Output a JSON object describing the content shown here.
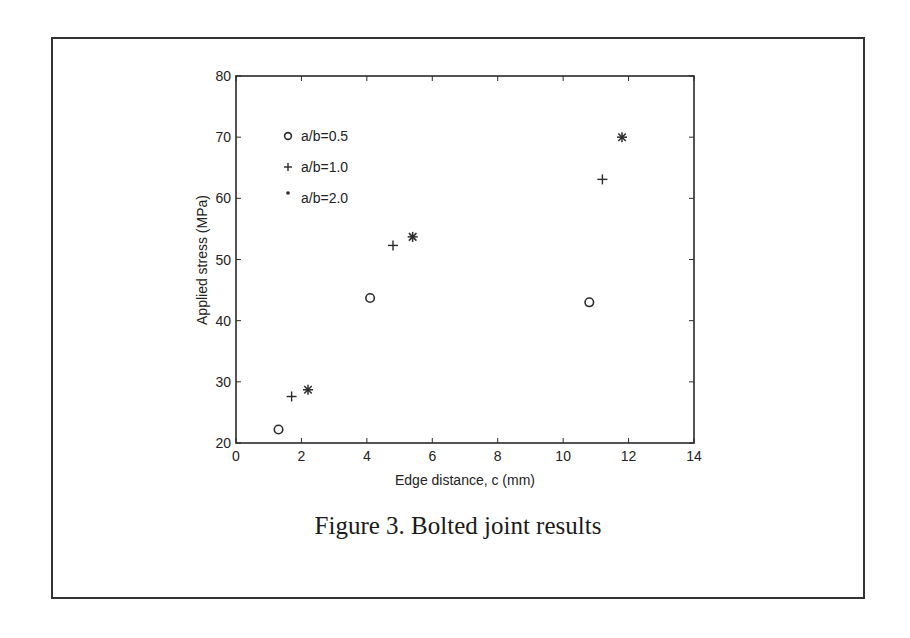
{
  "figure": {
    "caption": "Figure 3. Bolted joint results"
  },
  "chart_data": {
    "type": "scatter",
    "title": "",
    "xlabel": "Edge distance, c (mm)",
    "ylabel": "Applied stress (MPa)",
    "xlim": [
      0,
      14
    ],
    "ylim": [
      20,
      80
    ],
    "xticks": [
      0,
      2,
      4,
      6,
      8,
      10,
      12,
      14
    ],
    "yticks": [
      20,
      30,
      40,
      50,
      60,
      70,
      80
    ],
    "grid": false,
    "legend_position": "upper left (inside axes)",
    "series": [
      {
        "name": "a/b=0.5",
        "marker": "circle",
        "points": [
          [
            1.3,
            22.2
          ],
          [
            4.1,
            43.7
          ],
          [
            10.8,
            43.0
          ]
        ]
      },
      {
        "name": "a/b=1.0",
        "marker": "plus",
        "points": [
          [
            1.7,
            27.6
          ],
          [
            4.8,
            52.3
          ],
          [
            11.2,
            63.1
          ]
        ]
      },
      {
        "name": "a/b=2.0",
        "marker": "asterisk",
        "points": [
          [
            2.2,
            28.7
          ],
          [
            5.4,
            53.7
          ],
          [
            11.8,
            70.0
          ]
        ]
      }
    ]
  }
}
